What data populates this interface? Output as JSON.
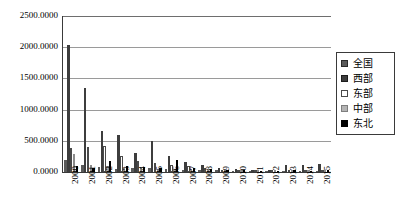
{
  "chart_data": {
    "type": "bar",
    "title": "",
    "xlabel": "",
    "ylabel": "",
    "ylim": [
      0,
      2500
    ],
    "grid": true,
    "legend_position": "right",
    "y_ticks": [
      "0.0000",
      "500.0000",
      "1000.0000",
      "1500.0000",
      "2000.0000",
      "2500.0000"
    ],
    "y_tick_values": [
      0,
      500,
      1000,
      1500,
      2000,
      2500
    ],
    "categories": [
      "2000",
      "2001",
      "2002",
      "2003",
      "2004",
      "2005",
      "2006",
      "2007",
      "2008",
      "2009",
      "2010",
      "2011",
      "2012",
      "2013",
      "2014",
      "2015"
    ],
    "series": [
      {
        "name": "全国",
        "color": "#5a5a5a",
        "values": [
          190,
          120,
          75,
          55,
          70,
          60,
          45,
          40,
          30,
          25,
          20,
          18,
          15,
          20,
          18,
          22
        ]
      },
      {
        "name": "西部",
        "color": "#3d3d3d",
        "values": [
          2030,
          1340,
          660,
          600,
          300,
          500,
          250,
          160,
          110,
          60,
          45,
          30,
          25,
          110,
          120,
          130
        ]
      },
      {
        "name": "东部",
        "color": "#ffffff",
        "values": [
          380,
          400,
          420,
          260,
          180,
          150,
          120,
          100,
          70,
          40,
          30,
          22,
          18,
          30,
          25,
          28
        ]
      },
      {
        "name": "中部",
        "color": "#b4b4b4",
        "values": [
          290,
          120,
          90,
          70,
          60,
          55,
          50,
          45,
          35,
          28,
          22,
          18,
          15,
          20,
          18,
          20
        ]
      },
      {
        "name": "东北",
        "color": "#000000",
        "values": [
          95,
          70,
          180,
          90,
          80,
          70,
          195,
          60,
          50,
          35,
          28,
          22,
          18,
          25,
          22,
          25
        ]
      }
    ]
  }
}
